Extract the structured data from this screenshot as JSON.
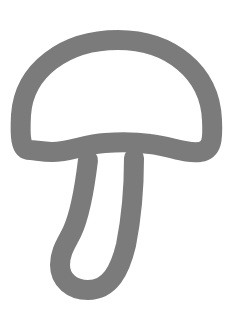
{
  "image": {
    "subject": "mushroom outline icon",
    "stroke_color": "#7b7b7b",
    "background_color": "#ffffff",
    "stroke_width": 20
  },
  "icon": {
    "name": "mushroom-icon",
    "label": "Mushroom"
  }
}
